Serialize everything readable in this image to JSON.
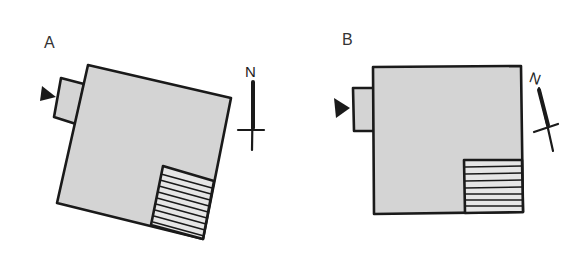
{
  "diagrams": [
    {
      "id": "A",
      "label": "A",
      "north_label": "N",
      "description": "Building plan rotated ~13° with north arrow pointing straight up",
      "colors": {
        "fill": "#d4d4d4",
        "stroke": "#1a1a1a"
      }
    },
    {
      "id": "B",
      "label": "B",
      "north_label": "N",
      "description": "Same building plan square to the page with north arrow tilted",
      "colors": {
        "fill": "#d4d4d4",
        "stroke": "#1a1a1a"
      }
    }
  ]
}
